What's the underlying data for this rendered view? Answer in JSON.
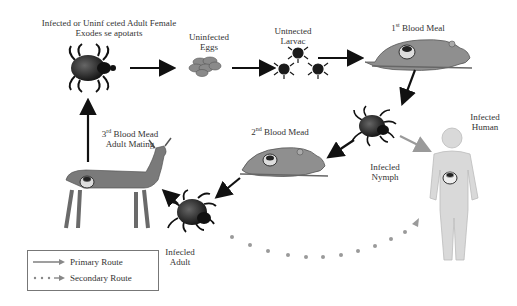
{
  "diagram": {
    "nodes": {
      "adult_female": {
        "line1": "Infected or Uninf ceted Adult Female",
        "line2": "Exodes se apotarts"
      },
      "eggs": {
        "line1": "Uninfected",
        "line2": "Eggs"
      },
      "larvae": {
        "line1": "Untnected",
        "line2": "Larvac"
      },
      "first_meal": {
        "ord": "1",
        "sup": "st",
        "text": " Blood Meal"
      },
      "nymph": {
        "line1": "Infecled",
        "line2": "Nymph"
      },
      "human": {
        "line1": "Infected",
        "line2": "Human"
      },
      "second_meal": {
        "ord": "2",
        "sup": "nd",
        "text": " Blood Mead"
      },
      "third_meal": {
        "ord": "3",
        "sup": "rd",
        "text": " Blood Mead",
        "line2": "Adult Mating"
      },
      "adult": {
        "line1": "Infecled",
        "line2": "Adult"
      }
    },
    "legend": {
      "primary": "Primary Route",
      "secondary": "Secondary Route"
    },
    "colors": {
      "tick": "#1a1a1a",
      "mouse": "#8f8f8f",
      "deer": "#7a7a7a",
      "human": "#d9d9d9",
      "primary_arrow": "#111111",
      "human_arrow": "#9a9a9a",
      "secondary_dots": "#9a9a9a"
    }
  }
}
